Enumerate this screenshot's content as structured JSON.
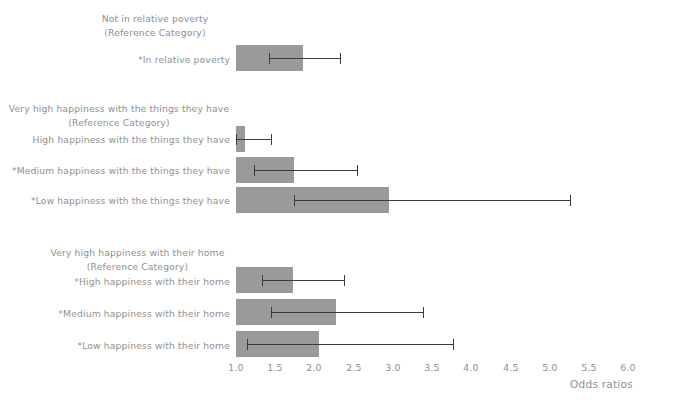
{
  "chart_data": {
    "type": "bar",
    "orientation": "horizontal",
    "title": "",
    "xlabel": "Odds ratios",
    "ylabel": "",
    "xlim": [
      1.0,
      6.2
    ],
    "xticks": [
      "1.0",
      "1.5",
      "2.0",
      "2.5",
      "3.0",
      "3.5",
      "4.0",
      "4.5",
      "5.0",
      "5.5",
      "6.0"
    ],
    "xtick_values": [
      1.0,
      1.5,
      2.0,
      2.5,
      3.0,
      3.5,
      4.0,
      4.5,
      5.0,
      5.5,
      6.0
    ],
    "grid": false,
    "legend": "none",
    "baseline": 1.0,
    "bar_color": "#9a9a9a",
    "error_color": "#3a3a3a",
    "groups": [
      {
        "reference": [
          "Not in relative poverty",
          "(Reference Category)"
        ],
        "categories": [
          {
            "label": "*In relative poverty",
            "value": 1.85,
            "ci_low": 1.42,
            "ci_high": 2.33,
            "significant": true
          }
        ]
      },
      {
        "reference": [
          "Very high happiness with the things they have",
          "(Reference Category)"
        ],
        "categories": [
          {
            "label": "High happiness with the things they have",
            "value": 1.11,
            "ci_low": 1.0,
            "ci_high": 1.45,
            "significant": false
          },
          {
            "label": "*Medium happiness with the things they have",
            "value": 1.74,
            "ci_low": 1.23,
            "ci_high": 2.54,
            "significant": true
          },
          {
            "label": "*Low happiness with the things they have",
            "value": 2.95,
            "ci_low": 1.74,
            "ci_high": 5.26,
            "significant": true
          }
        ]
      },
      {
        "reference": [
          "Very high happiness with their home",
          "(Reference Category)"
        ],
        "categories": [
          {
            "label": "*High happiness with their home",
            "value": 1.73,
            "ci_low": 1.33,
            "ci_high": 2.38,
            "significant": true
          },
          {
            "label": "*Medium happiness with their home",
            "value": 2.28,
            "ci_low": 1.45,
            "ci_high": 3.39,
            "significant": true
          },
          {
            "label": "*Low happiness with their home",
            "value": 2.06,
            "ci_low": 1.14,
            "ci_high": 3.77,
            "significant": true
          }
        ]
      }
    ]
  },
  "labels": {
    "group1_ref_line1": "Not in relative poverty",
    "group1_ref_line2": "(Reference Category)",
    "group1_cat1": "*In relative poverty",
    "group2_ref_line1": "Very high happiness with the things they have",
    "group2_ref_line2": "(Reference Category)",
    "group2_cat1": "High happiness with the things they have",
    "group2_cat2": "*Medium happiness with the things they have",
    "group2_cat3": "*Low happiness with the things they have",
    "group3_ref_line1": "Very high happiness with their home",
    "group3_ref_line2": "(Reference Category)",
    "group3_cat1": "*High happiness with their home",
    "group3_cat2": "*Medium happiness with their home",
    "group3_cat3": "*Low happiness with their home"
  },
  "axis": {
    "title": "Odds ratios",
    "t0": "1.0",
    "t1": "1.5",
    "t2": "2.0",
    "t3": "2.5",
    "t4": "3.0",
    "t5": "3.5",
    "t6": "4.0",
    "t7": "4.5",
    "t8": "5.0",
    "t9": "5.5",
    "t10": "6.0"
  }
}
